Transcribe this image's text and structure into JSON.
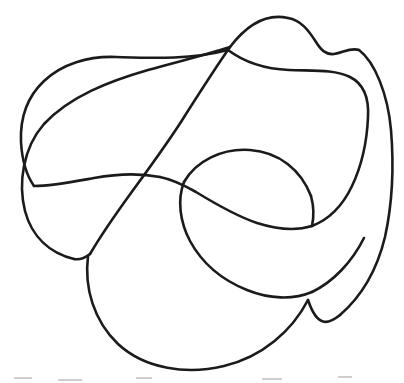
{
  "figure": {
    "medium": "pen-on-paper line drawing",
    "background_color": "#ffffff",
    "stroke_color": "#1b1b1b",
    "stroke_width": 2.6,
    "canvas": {
      "width": 404,
      "height": 383
    },
    "curve_label": "closed-loop-curve",
    "crossing_count": 6,
    "crossings": [
      {
        "name": "crossing-upper-middle",
        "x": 224,
        "y": 81
      },
      {
        "name": "crossing-center-left",
        "x": 163,
        "y": 175
      },
      {
        "name": "crossing-center-right",
        "x": 184,
        "y": 182
      },
      {
        "name": "crossing-lower-left",
        "x": 88,
        "y": 256
      },
      {
        "name": "crossing-right-middle",
        "x": 307,
        "y": 226
      },
      {
        "name": "crossing-lower-right",
        "x": 310,
        "y": 291
      }
    ],
    "extents": {
      "left_x": 20,
      "right_x": 392,
      "top_y": 17,
      "bottom_y": 369
    },
    "path_d": "M 288 18 C 263 14 243 26 226 48 C 212 66 200 82 188 100 C 171 125 152 153 136 180 C 119 209 103 236 92 258 C 84 276 82 296 87 314 C 94 337 113 356 141 365 C 172 374 204 370 229 361 C 257 351 281 334 295 312 C 307 293 311 272 310 250 C 309 226 305 205 297 186 C 289 168 277 155 261 149 C 243 143 224 146 209 155 C 195 164 187 178 184 191 C 180 208 185 225 195 240 C 206 257 223 270 243 277 C 268 286 297 288 323 281 C 350 273 371 256 383 233 C 393 212 394 187 391 164 C 387 138 376 113 360 93 C 346 75 330 61 318 46 C 308 34 299 21 288 18 Z",
    "path_d_secondary": "M 226 48 C 238 63 252 69 270 71 C 292 74 314 72 331 67 C 347 62 359 56 366 48 C 371 42 372 34 369 28 C 365 21 356 16 347 18 C 338 20 331 28 326 38 C 321 48 318 58 313 68 C 306 83 296 97 284 110 C 268 127 249 141 232 154 C 211 170 189 182 168 188 C 146 195 124 196 103 191 C 79 185 56 172 40 153 C 24 134 17 111 20 89 C 23 67 36 48 55 36 C 74 25 97 21 120 26 C 146 31 171 45 190 65 C 205 80 216 96 224 113",
    "segments": [
      {
        "name": "top-peak-left-flank",
        "description": "Left flank descending from top apex",
        "d": "M 288 18 C 266 13 246 26 230 47"
      },
      {
        "name": "top-peak-notch",
        "description": "Right flank with notch shelf",
        "d": "M 288 18 C 301 20 309 31 316 42 C 321 50 326 55 334 54 C 343 53 350 47 359 50"
      },
      {
        "name": "outer-right-descent",
        "description": "Outer right boundary sweeping down",
        "d": "M 359 50 C 375 62 388 95 391 130 C 394 166 392 205 385 237 C 377 270 362 296 340 315"
      },
      {
        "name": "outer-left-lobe",
        "description": "Large left lobe",
        "d": "M 230 47 C 206 55 176 62 148 70 C 110 81 70 96 44 124 C 23 148 18 183 25 211 C 32 237 50 253 74 259"
      },
      {
        "name": "bottom-lobe",
        "description": "Lower large loop",
        "d": "M 88 256 C 84 288 94 321 118 344 C 145 369 187 375 224 366 C 262 357 292 331 308 300"
      },
      {
        "name": "inner-middle-lobe",
        "description": "Central leaf-shaped inner lobe",
        "d": "M 184 182 C 196 161 222 148 250 150 C 279 152 301 170 311 196"
      }
    ],
    "paper_specks": [
      {
        "x": 14,
        "y": 377,
        "w": 18,
        "h": 2
      },
      {
        "x": 58,
        "y": 379,
        "w": 24,
        "h": 2
      },
      {
        "x": 136,
        "y": 377,
        "w": 16,
        "h": 2
      },
      {
        "x": 262,
        "y": 378,
        "w": 20,
        "h": 2
      },
      {
        "x": 338,
        "y": 376,
        "w": 14,
        "h": 2
      },
      {
        "x": 148,
        "y": 290,
        "w": 10,
        "h": 2
      },
      {
        "x": 196,
        "y": 296,
        "w": 8,
        "h": 2
      }
    ]
  }
}
